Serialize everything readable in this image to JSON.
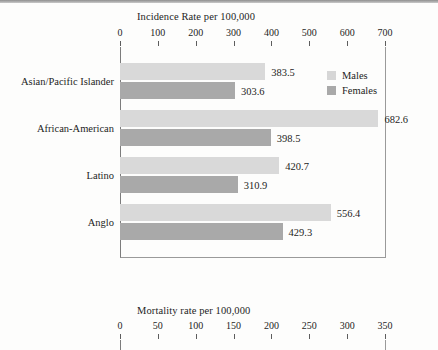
{
  "figure": {
    "legend": {
      "items": [
        {
          "label": "Males",
          "color": "#d9d9d9",
          "icon": "legend-swatch-males"
        },
        {
          "label": "Females",
          "color": "#a9a9a9",
          "icon": "legend-swatch-females"
        }
      ]
    }
  },
  "chart_data": [
    {
      "type": "bar",
      "orientation": "horizontal",
      "title": "Incidence Rate per 100,000",
      "xlabel": "",
      "ylabel": "",
      "xlim": [
        0,
        700
      ],
      "xticks": [
        0,
        100,
        200,
        300,
        400,
        500,
        600,
        700
      ],
      "xticklabels": [
        "0",
        "100",
        "200",
        "300",
        "400",
        "500",
        "600",
        "700"
      ],
      "grid": false,
      "legend_position": "inside-top-right",
      "categories": [
        "Asian/Pacific Islander",
        "African-American",
        "Latino",
        "Anglo"
      ],
      "series": [
        {
          "name": "Males",
          "color": "#d9d9d9",
          "values": [
            383.5,
            682.6,
            420.7,
            556.4
          ]
        },
        {
          "name": "Females",
          "color": "#a9a9a9",
          "values": [
            303.6,
            398.5,
            310.9,
            429.3
          ]
        }
      ],
      "data_labels": [
        [
          "383.5",
          "682.6",
          "420.7",
          "556.4"
        ],
        [
          "303.6",
          "398.5",
          "310.9",
          "429.3"
        ]
      ]
    },
    {
      "type": "bar",
      "orientation": "horizontal",
      "title": "Mortality rate per 100,000",
      "xlabel": "",
      "ylabel": "",
      "xlim": [
        0,
        350
      ],
      "xticks": [
        0,
        50,
        100,
        150,
        200,
        250,
        300,
        350
      ],
      "xticklabels": [
        "0",
        "50",
        "100",
        "150",
        "200",
        "250",
        "300",
        "350"
      ],
      "grid": false,
      "categories": [],
      "series": [],
      "note": "chart cropped at image bottom edge"
    }
  ]
}
